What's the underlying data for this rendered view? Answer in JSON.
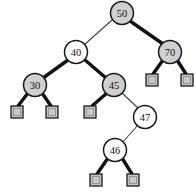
{
  "figure": {
    "kind": "red-black-tree-diagram",
    "width": 196,
    "height": 196,
    "background_color": "#ffffff"
  },
  "legend": {
    "black_node_fill": "#cfcfcf",
    "red_node_fill": "#ffffff",
    "node_stroke": "#1a1a1a",
    "nil_leaf_fill": "#c8c8c8",
    "thick_edge_color": "#111111",
    "thin_edge_color": "#444444"
  },
  "nodes": [
    {
      "id": "n50",
      "key": "50",
      "color": "black",
      "cx": 122,
      "cy": 13,
      "r": 11.5
    },
    {
      "id": "n40",
      "key": "40",
      "color": "red",
      "cx": 76,
      "cy": 52,
      "r": 11.5
    },
    {
      "id": "n70",
      "key": "70",
      "color": "black",
      "cx": 170,
      "cy": 52,
      "r": 11.5
    },
    {
      "id": "n30",
      "key": "30",
      "color": "black",
      "cx": 35,
      "cy": 85,
      "r": 11.5
    },
    {
      "id": "n45",
      "key": "45",
      "color": "black",
      "cx": 114,
      "cy": 85,
      "r": 11.5
    },
    {
      "id": "n47",
      "key": "47",
      "color": "red",
      "cx": 145,
      "cy": 117,
      "r": 11.5
    },
    {
      "id": "n46",
      "key": "46",
      "color": "red",
      "cx": 115,
      "cy": 150,
      "r": 11.5
    }
  ],
  "nil_leaves": [
    {
      "id": "nil-30-left",
      "x": 11,
      "y": 106,
      "size": 12
    },
    {
      "id": "nil-30-right",
      "x": 46,
      "y": 106,
      "size": 12
    },
    {
      "id": "nil-45-left",
      "x": 84,
      "y": 106,
      "size": 12
    },
    {
      "id": "nil-70-left",
      "x": 146,
      "y": 74,
      "size": 12
    },
    {
      "id": "nil-70-right",
      "x": 181,
      "y": 74,
      "size": 12
    },
    {
      "id": "nil-46-left",
      "x": 90,
      "y": 174,
      "size": 12
    },
    {
      "id": "nil-46-right",
      "x": 127,
      "y": 174,
      "size": 12
    }
  ],
  "edges": [
    {
      "id": "e-50-40",
      "from": "n50",
      "to": "n40",
      "weight": "thin",
      "x1": 112,
      "y1": 20,
      "x2": 84,
      "y2": 45
    },
    {
      "id": "e-50-70",
      "from": "n50",
      "to": "n70",
      "weight": "thick",
      "x1": 130,
      "y1": 21,
      "x2": 163,
      "y2": 44
    },
    {
      "id": "e-40-30",
      "from": "n40",
      "to": "n30",
      "weight": "thick",
      "x1": 68,
      "y1": 60,
      "x2": 43,
      "y2": 78
    },
    {
      "id": "e-40-45",
      "from": "n40",
      "to": "n45",
      "weight": "thick",
      "x1": 85,
      "y1": 60,
      "x2": 106,
      "y2": 78
    },
    {
      "id": "e-30-nill",
      "from": "n30",
      "to": "nil-30-left",
      "weight": "thick",
      "x1": 28,
      "y1": 93,
      "x2": 18,
      "y2": 106
    },
    {
      "id": "e-30-nilr",
      "from": "n30",
      "to": "nil-30-right",
      "weight": "thick",
      "x1": 42,
      "y1": 93,
      "x2": 51,
      "y2": 106
    },
    {
      "id": "e-45-nill",
      "from": "n45",
      "to": "nil-45-left",
      "weight": "thick",
      "x1": 107,
      "y1": 93,
      "x2": 92,
      "y2": 106
    },
    {
      "id": "e-45-47",
      "from": "n45",
      "to": "n47",
      "weight": "thin",
      "x1": 122,
      "y1": 93,
      "x2": 139,
      "y2": 109
    },
    {
      "id": "e-47-46",
      "from": "n47",
      "to": "n46",
      "weight": "thin",
      "x1": 138,
      "y1": 125,
      "x2": 122,
      "y2": 143
    },
    {
      "id": "e-70-nill",
      "from": "n70",
      "to": "nil-70-left",
      "weight": "thick",
      "x1": 163,
      "y1": 60,
      "x2": 153,
      "y2": 74
    },
    {
      "id": "e-70-nilr",
      "from": "n70",
      "to": "nil-70-right",
      "weight": "thick",
      "x1": 177,
      "y1": 60,
      "x2": 186,
      "y2": 74
    },
    {
      "id": "e-46-nill",
      "from": "n46",
      "to": "nil-46-left",
      "weight": "thick",
      "x1": 108,
      "y1": 158,
      "x2": 97,
      "y2": 174
    },
    {
      "id": "e-46-nilr",
      "from": "n46",
      "to": "nil-46-right",
      "weight": "thick",
      "x1": 122,
      "y1": 158,
      "x2": 132,
      "y2": 174
    }
  ]
}
